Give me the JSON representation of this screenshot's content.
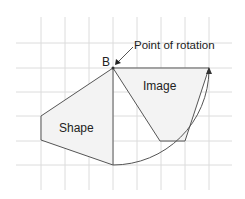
{
  "diagram": {
    "labels": {
      "point": "B",
      "point_of_rotation": "Point of rotation",
      "shape": "Shape",
      "image": "Image"
    },
    "grid": {
      "x_lines": [
        41,
        65,
        89,
        113,
        137,
        161,
        185,
        209
      ],
      "y_lines": [
        43,
        68,
        92,
        116,
        141,
        165
      ],
      "color": "#d9d9d9"
    },
    "colors": {
      "outline": "#555555",
      "fill": "#f2f2f2",
      "text": "#222222"
    }
  }
}
